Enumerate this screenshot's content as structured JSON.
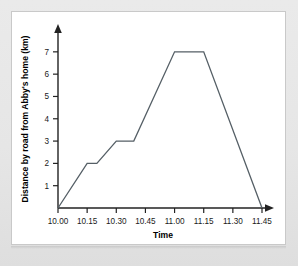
{
  "figure": {
    "background_color": "#e9e9e9",
    "panel_color": "#ffffff",
    "panel_border_color": "#c9c9c9",
    "axis_color": "#222222",
    "line_color": "#555f66"
  },
  "chart_data": {
    "type": "line",
    "title": "",
    "xlabel": "Time",
    "ylabel": "Distance by road from Abby's home (km)",
    "x_tick_labels": [
      "10.00",
      "10.15",
      "10.30",
      "10.45",
      "11.00",
      "11.15",
      "11.30",
      "11.45"
    ],
    "y_tick_labels": [
      "1",
      "2",
      "3",
      "4",
      "5",
      "6",
      "7"
    ],
    "y_tick_values": [
      1,
      2,
      3,
      4,
      5,
      6,
      7
    ],
    "xlim": [
      0,
      105
    ],
    "ylim": [
      0,
      7.8
    ],
    "grid": false,
    "legend": false,
    "x_axis_arrow": true,
    "y_axis_arrow": true,
    "series": [
      {
        "name": "Abby's journey",
        "x_times": [
          "10.00",
          "10.15",
          "10.20",
          "10.30",
          "10.39",
          "11.00",
          "11.15",
          "11.45"
        ],
        "x": [
          0,
          15,
          20,
          30,
          39,
          60,
          75,
          105
        ],
        "values": [
          0,
          2,
          2,
          3,
          3,
          7,
          7,
          0
        ]
      }
    ],
    "annotations": []
  },
  "labels": {
    "x_axis_title": "Time",
    "y_axis_title": "Distance by road from Abby's home (km)"
  }
}
